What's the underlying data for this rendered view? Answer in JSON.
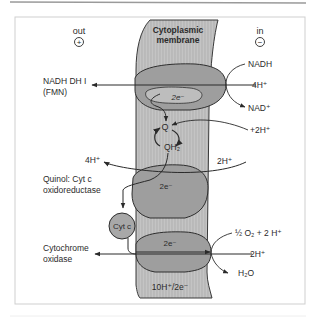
{
  "diagram": {
    "sides": {
      "out": {
        "label": "out",
        "sign": "+"
      },
      "in": {
        "label": "in",
        "sign": "−"
      }
    },
    "membrane": {
      "label_line1": "Cytoplasmic",
      "label_line2": "membrane"
    },
    "complexes": [
      {
        "id": "nadh-dh",
        "name_line1": "NADH DH I",
        "name_line2": "(FMN)",
        "electrons": "2e⁻"
      },
      {
        "id": "quinol-cytc",
        "name_line1": "Quinol: Cyt c",
        "name_line2": "oxidoreductase",
        "electrons": "2e⁻"
      },
      {
        "id": "cyt-oxidase",
        "name_line1": "Cytochrome",
        "name_line2": "oxidase",
        "electrons": "2e⁻"
      }
    ],
    "species": {
      "nadh": "NADH",
      "h4_in": "4H⁺",
      "nad": "NAD⁺",
      "h2_plus": "+2H⁺",
      "q": "Q",
      "qh2": "QH₂",
      "h4_out": "4H⁺",
      "h2_in_c3": "2H⁺",
      "cytc": "Cyt c",
      "o2": "½ O₂ + 2 H⁺",
      "h2_in_c4": "2H⁺",
      "h2o": "H₂O"
    },
    "stoichiometry": "10H⁺/2e⁻"
  },
  "colors": {
    "membrane": "#b9b9b9",
    "complex": "#9d9d9d",
    "complex_inner": "#bdbdbd",
    "line": "#2a2a2a",
    "frame": "#c8c8c8"
  }
}
